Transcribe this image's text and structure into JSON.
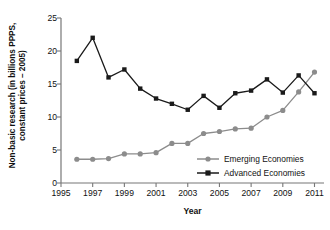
{
  "chart_data": {
    "type": "line",
    "title": "",
    "xlabel": "Year",
    "ylabel": "Non-basic research (in billions PPPS, constant prices – 2005)",
    "ylabel_line1": "Non-basic research (in billions PPPS,",
    "ylabel_line2": "constant prices – 2005)",
    "x": [
      1996,
      1997,
      1998,
      1999,
      2000,
      2001,
      2002,
      2003,
      2004,
      2005,
      2006,
      2007,
      2008,
      2009,
      2010,
      2011
    ],
    "xlim": [
      1995,
      2011.6
    ],
    "ylim": [
      0,
      25
    ],
    "xticks": [
      1995,
      1997,
      1999,
      2001,
      2003,
      2005,
      2007,
      2009,
      2011
    ],
    "xtick_labels": [
      "1995",
      "1997",
      "1999",
      "2001",
      "2003",
      "2005",
      "2007",
      "2009",
      "2011"
    ],
    "yticks": [
      0,
      5,
      10,
      15,
      20,
      25
    ],
    "ytick_labels": [
      "0",
      "5",
      "10",
      "15",
      "20",
      "25"
    ],
    "grid": false,
    "legend_position": "inside-lower-right",
    "series": [
      {
        "name": "Emerging Economies",
        "color": "#8c8c8c",
        "marker": "circle",
        "values": [
          3.6,
          3.6,
          3.7,
          4.4,
          4.4,
          4.6,
          6.0,
          6.0,
          7.5,
          7.8,
          8.2,
          8.3,
          10.0,
          11.0,
          13.8,
          16.8
        ]
      },
      {
        "name": "Advanced Economies",
        "color": "#1a1a1a",
        "marker": "square",
        "values": [
          18.5,
          22.0,
          16.0,
          17.2,
          14.3,
          12.8,
          12.0,
          11.1,
          13.2,
          11.4,
          13.6,
          14.0,
          15.7,
          13.7,
          16.3,
          13.6
        ]
      }
    ]
  },
  "legend": {
    "items": [
      {
        "label": "Emerging Economies"
      },
      {
        "label": "Advanced Economies"
      }
    ]
  },
  "axis": {
    "color": "#777777"
  }
}
